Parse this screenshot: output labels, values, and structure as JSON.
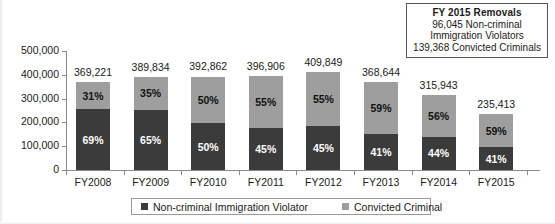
{
  "chart_data": {
    "type": "bar",
    "subtype": "stacked-percent-with-totals",
    "title": "",
    "xlabel": "",
    "ylabel": "",
    "ylim": [
      0,
      500000
    ],
    "ytick_labels": [
      "0",
      "100,000",
      "200,000",
      "300,000",
      "400,000",
      "500,000"
    ],
    "ytick_values": [
      0,
      100000,
      200000,
      300000,
      400000,
      500000
    ],
    "grid": false,
    "legend_position": "bottom",
    "categories": [
      "FY2008",
      "FY2009",
      "FY2010",
      "FY2011",
      "FY2012",
      "FY2013",
      "FY2014",
      "FY2015"
    ],
    "totals": [
      369221,
      389834,
      392862,
      396906,
      409849,
      368644,
      315943,
      235413
    ],
    "total_labels": [
      "369,221",
      "389,834",
      "392,862",
      "396,906",
      "409,849",
      "368,644",
      "315,943",
      "235,413"
    ],
    "series": [
      {
        "name": "Non-criminal Immigration Violator",
        "color": "#3b3b3b",
        "stack_position": "bottom",
        "percent_labels": [
          "69%",
          "65%",
          "50%",
          "45%",
          "45%",
          "41%",
          "44%",
          "41%"
        ],
        "percents": [
          69,
          65,
          50,
          45,
          45,
          41,
          44,
          41
        ]
      },
      {
        "name": "Convicted Criminal",
        "color": "#9e9e9e",
        "stack_position": "top",
        "percent_labels": [
          "31%",
          "35%",
          "50%",
          "55%",
          "55%",
          "59%",
          "56%",
          "59%"
        ],
        "percents": [
          31,
          35,
          50,
          55,
          55,
          59,
          56,
          59
        ]
      }
    ]
  },
  "callout": {
    "title": "FY 2015 Removals",
    "lines": [
      "96,045 Non-criminal",
      "Immigration Violators",
      "139,368 Convicted Criminals"
    ]
  },
  "legend": {
    "items": [
      {
        "label": "Non-criminal Immigration Violator",
        "color": "#3b3b3b"
      },
      {
        "label": "Convicted Criminal",
        "color": "#9e9e9e"
      }
    ]
  }
}
